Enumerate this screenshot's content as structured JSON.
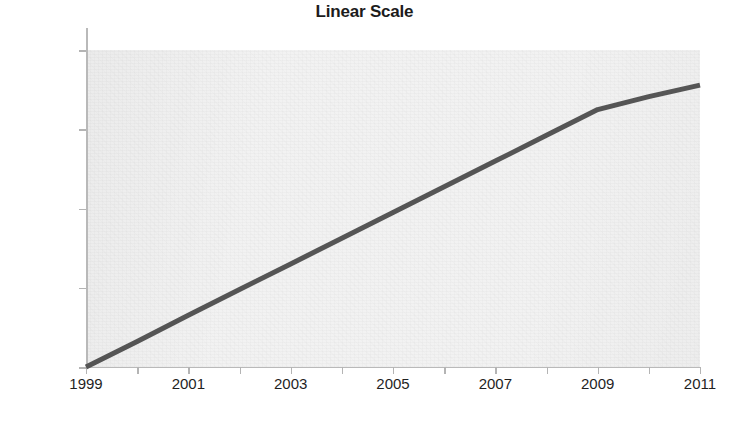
{
  "chart_data": {
    "type": "line",
    "title": "Linear Scale",
    "xlabel": "",
    "ylabel": "",
    "grid": false,
    "legend": false,
    "legend_position": "none",
    "yscale": "log",
    "xscale": "linear",
    "xlim": [
      1999,
      2011
    ],
    "ylim": [
      1,
      10000
    ],
    "x_tick_labels": [
      "1999",
      "2001",
      "2003",
      "2005",
      "2007",
      "2009",
      "2011"
    ],
    "x_ticks": [
      1999,
      2001,
      2003,
      2005,
      2007,
      2009,
      2011
    ],
    "x_minor_ticks": [
      1999,
      2000,
      2001,
      2002,
      2003,
      2004,
      2005,
      2006,
      2007,
      2008,
      2009,
      2010,
      2011
    ],
    "y_tick_labels": [
      "10000",
      "1000",
      "100",
      "10",
      "1"
    ],
    "y_ticks": [
      10000,
      1000,
      100,
      10,
      1
    ],
    "series": [
      {
        "name": "growth",
        "color": "#555555",
        "width": 5,
        "x": [
          1999,
          2000,
          2001,
          2002,
          2003,
          2004,
          2005,
          2006,
          2007,
          2008,
          2009,
          2010,
          2011
        ],
        "values": [
          1,
          2.1,
          4.5,
          9.5,
          20,
          42,
          89,
          188,
          397,
          838,
          1770,
          2580,
          3600
        ]
      }
    ],
    "annotations": []
  },
  "colors": {
    "line": "#555555",
    "plot_background": "#f2f2f2",
    "page_background": "#ffffff",
    "axis": "#b9b9b9",
    "text": "#1f1f1f"
  }
}
